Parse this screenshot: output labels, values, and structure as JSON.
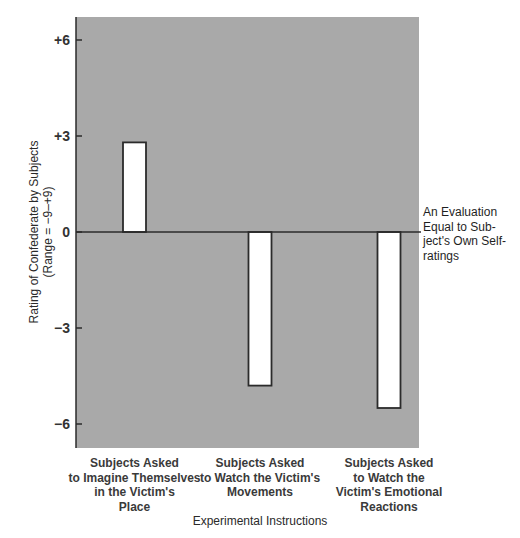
{
  "chart_data": {
    "type": "bar",
    "title": "",
    "categories": [
      [
        "Subjects Asked",
        "to Imagine Themselves",
        "in the Victim's",
        "Place"
      ],
      [
        "Subjects Asked",
        "to Watch the Victim's",
        "Movements"
      ],
      [
        "Subjects Asked",
        "to Watch the",
        "Victim's Emotional",
        "Reactions"
      ]
    ],
    "values": [
      2.8,
      -4.8,
      -5.5
    ],
    "xlabel": "Experimental Instructions",
    "ylabel": [
      "Rating of Confederate by Subjects",
      "(Range = −9–+9)"
    ],
    "ylim": [
      -7,
      7
    ],
    "yticks": [
      6,
      3,
      0,
      -3,
      -6
    ],
    "ytick_labels": [
      "+6",
      "+3",
      "0",
      "−3",
      "−6"
    ],
    "grid": false,
    "reference_line": {
      "value": 0,
      "label": [
        "An Evaluation",
        "Equal to Sub-",
        "ject's Own Self-",
        "ratings"
      ]
    },
    "colors": {
      "plot_background": "#a9a9a9",
      "bar_fill": "#ffffff",
      "bar_stroke": "#2b2b2b",
      "axis": "#2b2b2b"
    }
  }
}
